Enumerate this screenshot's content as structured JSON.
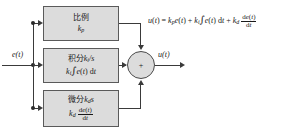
{
  "diagram": {
    "input_label": "e(t)",
    "output_label": "u(t)",
    "sum_symbol": "+",
    "blocks": [
      {
        "name": "proportional",
        "line1_cjk": "比例",
        "line1_math": "",
        "gain": "k",
        "gain_sub": "p",
        "line2": "k_p"
      },
      {
        "name": "integral",
        "line1_cjk": "积分",
        "line1_math": "k_i/s",
        "gain": "k",
        "gain_sub": "i",
        "line2": "k_i ∫e(t) dt"
      },
      {
        "name": "derivative",
        "line1_cjk": "微分",
        "line1_math": "k_d s",
        "gain": "k",
        "gain_sub": "d",
        "line2": "k_d de(t)/dt"
      }
    ],
    "formula": "u(t) = k_p e(t) + k_i ∫e(t) dt + k_d de(t)/dt",
    "formula_parts": {
      "lhs": "u",
      "lhs_arg": "(t)",
      "eq": "=",
      "term1_gain": "k",
      "term1_sub": "p",
      "term1_var": "e(t)",
      "plus1": "+",
      "term2_gain": "k",
      "term2_sub": "i",
      "term2_integrand": "e(t) dt",
      "plus2": "+",
      "term3_gain": "k",
      "term3_sub": "d",
      "term3_num": "de(t)",
      "term3_den": "dt"
    },
    "colors": {
      "block_fill": "#dcdcdc",
      "block_border": "#5a5a5a",
      "wire": "#3a3a3a",
      "text": "#1a1a1a",
      "background": "#ffffff"
    }
  }
}
